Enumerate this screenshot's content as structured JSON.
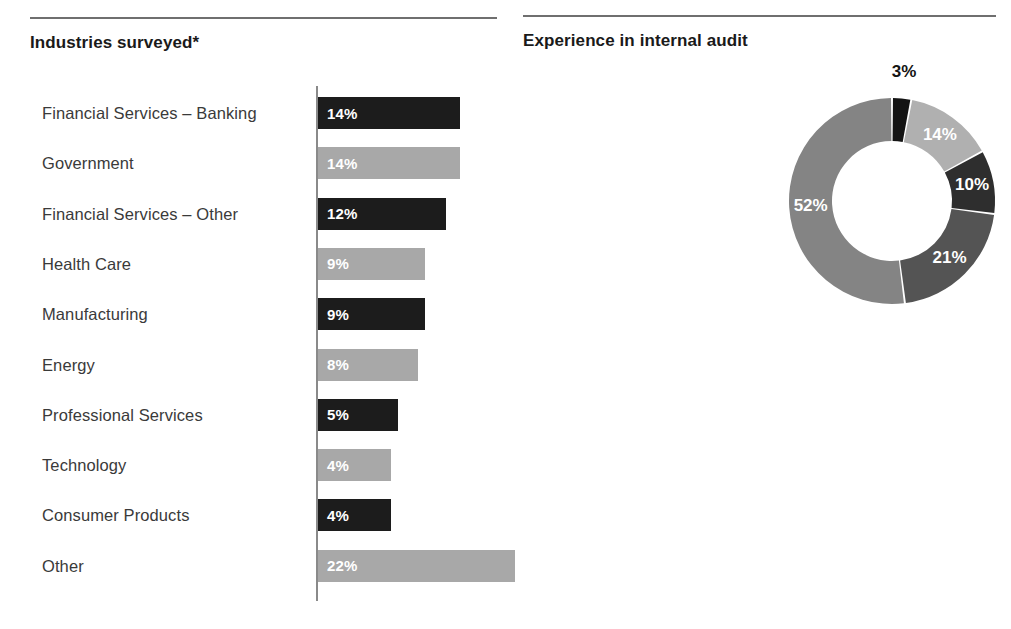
{
  "left_panel": {
    "title": "Industries surveyed*",
    "chart_data": {
      "type": "bar",
      "title": "Industries surveyed*",
      "orientation": "horizontal",
      "xlabel": "",
      "ylabel": "",
      "categories": [
        "Financial Services – Banking",
        "Government",
        "Financial Services – Other",
        "Health Care",
        "Manufacturing",
        "Energy",
        "Professional Services",
        "Technology",
        "Consumer Products",
        "Other"
      ],
      "values": [
        14,
        14,
        12,
        9,
        9,
        8,
        5,
        4,
        4,
        22
      ],
      "value_labels": [
        "14%",
        "14%",
        "12%",
        "9%",
        "9%",
        "8%",
        "5%",
        "4%",
        "4%",
        "22%"
      ],
      "bar_colors": [
        "#1c1c1c",
        "#a8a8a8",
        "#1c1c1c",
        "#a8a8a8",
        "#1c1c1c",
        "#a8a8a8",
        "#1c1c1c",
        "#a8a8a8",
        "#1c1c1c",
        "#a8a8a8"
      ],
      "grid": false,
      "legend": false
    }
  },
  "right_panel": {
    "title": "Experience in internal audit",
    "legend": [
      {
        "label": "Less than one year",
        "color": "#141414"
      },
      {
        "label": "1-3 years",
        "color": "#b0b0b0"
      },
      {
        "label": "4-5 years",
        "color": "#2e2e2e"
      },
      {
        "label": "6-10 years",
        "color": "#545454"
      },
      {
        "label": "More than 10 years",
        "color": "#848484"
      }
    ],
    "chart_data": {
      "type": "pie",
      "variant": "donut",
      "title": "Experience in internal audit",
      "start_angle_deg": 0,
      "direction": "clockwise",
      "labels": [
        "Less than one year",
        "1-3 years",
        "4-5 years",
        "6-10 years",
        "More than 10 years"
      ],
      "values": [
        3,
        14,
        10,
        21,
        52
      ],
      "value_labels": [
        "3%",
        "14%",
        "10%",
        "21%",
        "52%"
      ],
      "colors": [
        "#141414",
        "#b0b0b0",
        "#2e2e2e",
        "#545454",
        "#848484"
      ],
      "label_placement": [
        "outside",
        "inside",
        "inside",
        "inside",
        "inside"
      ],
      "legend_position": "left"
    }
  }
}
